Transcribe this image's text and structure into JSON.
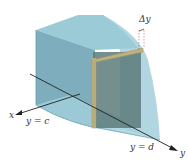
{
  "figure": {
    "labels": {
      "delta_y": "Δy",
      "x_axis": "x",
      "y_axis": "y",
      "y_equals_c": "y = c",
      "y_equals_d": "y = d"
    },
    "colors": {
      "solid_light": "#9cc7d4",
      "solid_mid": "#7fb0bf",
      "solid_dark": "#6a98a6",
      "slice_fill": "#5b7878",
      "slice_border": "#b8ad7a",
      "axis": "#222222",
      "delta_marker": "#c0504d"
    }
  }
}
